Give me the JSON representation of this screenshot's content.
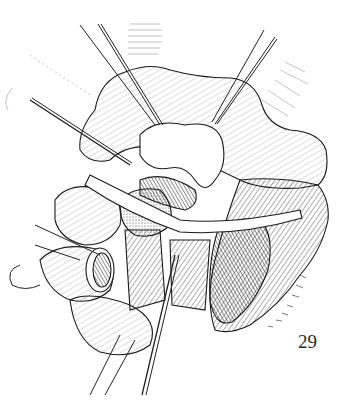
{
  "figure": {
    "number": "29",
    "colors": {
      "ink": "#1a1a1a",
      "paper": "#ffffff",
      "hatch": "#555555"
    }
  }
}
